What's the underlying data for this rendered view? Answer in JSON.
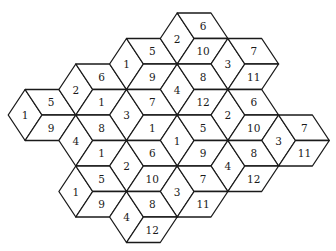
{
  "diagram": {
    "title": "",
    "geometry": {
      "origin_x": 42,
      "origin_y": 115,
      "col_step": 50.7,
      "s": 16.9,
      "h": 25.5
    },
    "colors": {
      "stroke": "#1a1a1a",
      "fill": "#ffffff",
      "text": "#1a1a1a"
    },
    "hexagons": [
      {
        "id": "A",
        "col": 0,
        "cy": 115,
        "left": "1",
        "top": "5",
        "bottom": "9"
      },
      {
        "id": "B",
        "col": 1,
        "cy": 89.5,
        "left": "2",
        "top": "6",
        "bottom": "1"
      },
      {
        "id": "C",
        "col": 2,
        "cy": 64,
        "left": "1",
        "top": "5",
        "bottom": "9"
      },
      {
        "id": "D",
        "col": 3,
        "cy": 38.5,
        "left": "2",
        "top": "6",
        "bottom": "10"
      },
      {
        "id": "E",
        "col": 4,
        "cy": 64,
        "left": "3",
        "top": "7",
        "bottom": "11"
      },
      {
        "id": "F",
        "col": 3,
        "cy": 89.5,
        "left": "4",
        "top": "8",
        "bottom": "12"
      },
      {
        "id": "G",
        "col": 2,
        "cy": 115,
        "left": "3",
        "top": "7",
        "bottom": "1"
      },
      {
        "id": "H",
        "col": 1,
        "cy": 140.5,
        "left": "4",
        "top": "8",
        "bottom": "1"
      },
      {
        "id": "I",
        "col": 4,
        "cy": 115,
        "left": "2",
        "top": "6",
        "bottom": "10"
      },
      {
        "id": "J",
        "col": 5,
        "cy": 140.5,
        "left": "3",
        "top": "7",
        "bottom": "11"
      },
      {
        "id": "K",
        "col": 3,
        "cy": 140.5,
        "left": "1",
        "top": "5",
        "bottom": "9"
      },
      {
        "id": "L",
        "col": 2,
        "cy": 166,
        "left": "2",
        "top": "6",
        "bottom": "10"
      },
      {
        "id": "M",
        "col": 4,
        "cy": 166,
        "left": "4",
        "top": "8",
        "bottom": "12"
      },
      {
        "id": "N",
        "col": 1,
        "cy": 191.5,
        "left": "1",
        "top": "5",
        "bottom": "9"
      },
      {
        "id": "O",
        "col": 3,
        "cy": 191.5,
        "left": "3",
        "top": "7",
        "bottom": "11"
      },
      {
        "id": "P",
        "col": 2,
        "cy": 217,
        "left": "4",
        "top": "8",
        "bottom": "12"
      }
    ]
  }
}
